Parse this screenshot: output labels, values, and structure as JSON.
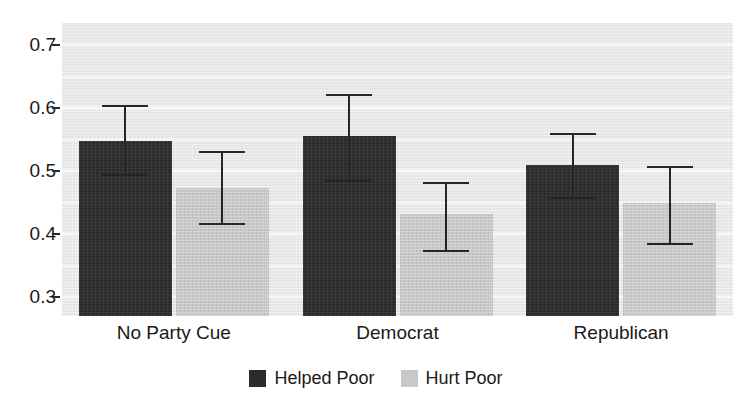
{
  "chart_data": {
    "type": "bar",
    "title": "",
    "subtitle": "",
    "xlabel": "",
    "ylabel": "",
    "categories": [
      "No Party Cue",
      "Democrat",
      "Republican"
    ],
    "series": [
      {
        "name": "Helped Poor",
        "color": "#2b2b2b",
        "values": [
          0.548,
          0.556,
          0.509
        ],
        "error_low": [
          0.492,
          0.483,
          0.455
        ],
        "error_high": [
          0.605,
          0.622,
          0.561
        ]
      },
      {
        "name": "Hurt Poor",
        "color": "#c8c8c8",
        "values": [
          0.473,
          0.432,
          0.45
        ],
        "error_low": [
          0.414,
          0.372,
          0.382
        ],
        "error_high": [
          0.532,
          0.482,
          0.508
        ]
      }
    ],
    "ylim": [
      0.27,
      0.735
    ],
    "yticks": [
      0.3,
      0.4,
      0.5,
      0.6,
      0.7
    ],
    "ytick_labels": [
      "0.3",
      "0.4",
      "0.5",
      "0.6",
      "0.7"
    ],
    "grid": true,
    "grid_color": "#f7f7f7",
    "panel_background": "#e8e8e8",
    "legend_position": "bottom-center",
    "error_bars": "95% confidence interval"
  },
  "legend": {
    "items": [
      {
        "label": "Helped Poor",
        "swatch": "helped"
      },
      {
        "label": "Hurt Poor",
        "swatch": "hurt"
      }
    ]
  }
}
